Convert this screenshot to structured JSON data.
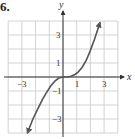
{
  "problem": {
    "number": "6."
  },
  "colors": {
    "grid": "#c8c8c8",
    "axis": "#333333",
    "curve": "#555555"
  },
  "chart_data": {
    "type": "line",
    "title": "",
    "xlabel": "x",
    "ylabel": "y",
    "xlim": [
      -4,
      4
    ],
    "ylim": [
      -4,
      4
    ],
    "grid": true,
    "x_tick_labels": [
      "-3",
      "1",
      "3"
    ],
    "y_tick_labels": [
      "3",
      "1",
      "-1",
      "-3"
    ],
    "series": [
      {
        "name": "curve",
        "arrows_both_ends": true,
        "points": [
          [
            -2.6,
            -4.0
          ],
          [
            -2.2,
            -3.0
          ],
          [
            -1.8,
            -2.2
          ],
          [
            -1.5,
            -1.6
          ],
          [
            -1.2,
            -1.1
          ],
          [
            -0.9,
            -0.65
          ],
          [
            -0.6,
            -0.3
          ],
          [
            -0.3,
            -0.08
          ],
          [
            0,
            0
          ],
          [
            0.3,
            0.0
          ],
          [
            0.6,
            0.05
          ],
          [
            0.9,
            0.2
          ],
          [
            1.1,
            0.35
          ],
          [
            1.4,
            0.7
          ],
          [
            1.7,
            1.2
          ],
          [
            2.0,
            1.9
          ],
          [
            2.3,
            2.7
          ],
          [
            2.5,
            3.3
          ],
          [
            2.7,
            3.9
          ]
        ]
      }
    ]
  },
  "labels": {
    "x_axis": "x",
    "y_axis": "y",
    "x_ticks": [
      {
        "value": -3,
        "text": "−3"
      },
      {
        "value": 1,
        "text": "1"
      },
      {
        "value": 3,
        "text": "3"
      }
    ],
    "y_ticks": [
      {
        "value": 3,
        "text": "3"
      },
      {
        "value": 1,
        "text": "1"
      },
      {
        "value": -1,
        "text": "−1"
      },
      {
        "value": -3,
        "text": "−3"
      }
    ]
  }
}
